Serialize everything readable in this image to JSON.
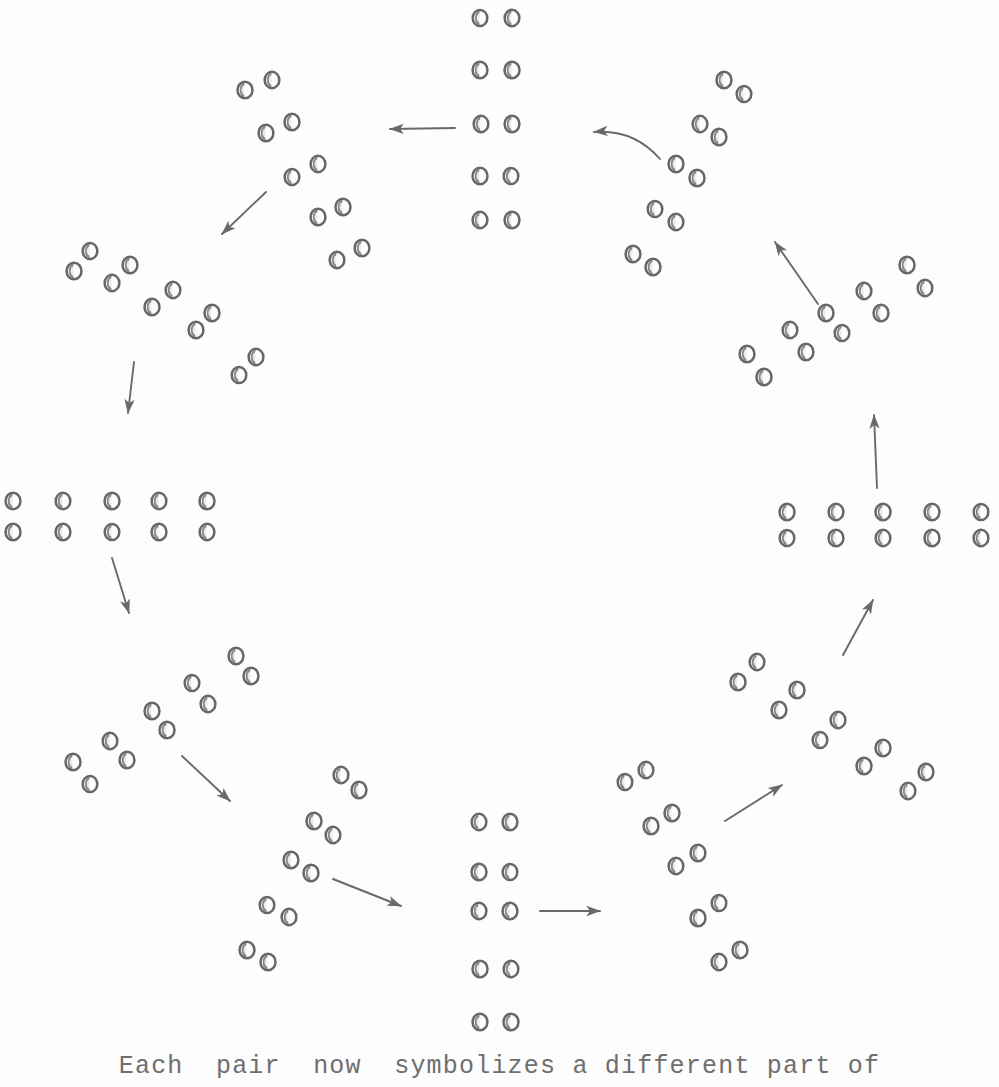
{
  "figure": {
    "type": "cycle-diagram",
    "background_color": "#fdfdfd",
    "ink_color": "#5a5a5a",
    "caption": "Each  pair  now  symbolizes a different part of",
    "pair_count_per_group": 5,
    "group_count": 12,
    "arrow_count": 12,
    "flow_direction": "counter-clockwise"
  },
  "chart_data": {
    "type": "scatter",
    "title": "",
    "xlabel": "",
    "ylabel": "",
    "groups": [
      {
        "id": "group-top",
        "name": "top-vertical-column",
        "orientation": "vertical",
        "angle_deg": 90,
        "pairs": [
          {
            "a": [
              480,
              18
            ],
            "b": [
              512,
              18
            ]
          },
          {
            "a": [
              480,
              70
            ],
            "b": [
              512,
              70
            ]
          },
          {
            "a": [
              481,
              124
            ],
            "b": [
              512,
              124
            ]
          },
          {
            "a": [
              480,
              176
            ],
            "b": [
              511,
              176
            ]
          },
          {
            "a": [
              480,
              220
            ],
            "b": [
              512,
              220
            ]
          }
        ]
      },
      {
        "id": "group-upper-left",
        "name": "upper-left-diagonal",
        "orientation": "diagonal-down-right",
        "angle_deg": 120,
        "pairs": [
          {
            "a": [
              245,
              90
            ],
            "b": [
              272,
              80
            ]
          },
          {
            "a": [
              266,
              133
            ],
            "b": [
              292,
              122
            ]
          },
          {
            "a": [
              292,
              177
            ],
            "b": [
              318,
              164
            ]
          },
          {
            "a": [
              318,
              217
            ],
            "b": [
              343,
              207
            ]
          },
          {
            "a": [
              337,
              260
            ],
            "b": [
              362,
              248
            ]
          }
        ]
      },
      {
        "id": "group-left-upper",
        "name": "left-upper-diagonal",
        "orientation": "diagonal-down-right",
        "angle_deg": 150,
        "pairs": [
          {
            "a": [
              74,
              271
            ],
            "b": [
              90,
              251
            ]
          },
          {
            "a": [
              112,
              283
            ],
            "b": [
              130,
              265
            ]
          },
          {
            "a": [
              152,
              307
            ],
            "b": [
              173,
              290
            ]
          },
          {
            "a": [
              196,
              330
            ],
            "b": [
              212,
              313
            ]
          },
          {
            "a": [
              239,
              375
            ],
            "b": [
              256,
              357
            ]
          }
        ]
      },
      {
        "id": "group-left",
        "name": "left-horizontal-row",
        "orientation": "horizontal",
        "angle_deg": 180,
        "pairs": [
          {
            "a": [
              13,
              501
            ],
            "b": [
              13,
              532
            ]
          },
          {
            "a": [
              63,
              501
            ],
            "b": [
              63,
              532
            ]
          },
          {
            "a": [
              112,
              501
            ],
            "b": [
              112,
              532
            ]
          },
          {
            "a": [
              159,
              501
            ],
            "b": [
              159,
              532
            ]
          },
          {
            "a": [
              207,
              501
            ],
            "b": [
              207,
              532
            ]
          }
        ]
      },
      {
        "id": "group-lower-left",
        "name": "lower-left-diagonal",
        "orientation": "diagonal-down-left",
        "angle_deg": 210,
        "pairs": [
          {
            "a": [
              236,
              656
            ],
            "b": [
              251,
              676
            ]
          },
          {
            "a": [
              192,
              683
            ],
            "b": [
              208,
              704
            ]
          },
          {
            "a": [
              152,
              711
            ],
            "b": [
              167,
              730
            ]
          },
          {
            "a": [
              110,
              741
            ],
            "b": [
              127,
              760
            ]
          },
          {
            "a": [
              73,
              762
            ],
            "b": [
              90,
              784
            ]
          }
        ]
      },
      {
        "id": "group-bottom-left",
        "name": "bottom-left-diagonal",
        "orientation": "diagonal-down-left",
        "angle_deg": 240,
        "pairs": [
          {
            "a": [
              341,
              775
            ],
            "b": [
              359,
              790
            ]
          },
          {
            "a": [
              314,
              821
            ],
            "b": [
              333,
              835
            ]
          },
          {
            "a": [
              291,
              860
            ],
            "b": [
              311,
              873
            ]
          },
          {
            "a": [
              267,
              905
            ],
            "b": [
              289,
              917
            ]
          },
          {
            "a": [
              247,
              950
            ],
            "b": [
              268,
              962
            ]
          }
        ]
      },
      {
        "id": "group-bottom",
        "name": "bottom-vertical-column",
        "orientation": "vertical",
        "angle_deg": 270,
        "pairs": [
          {
            "a": [
              479,
              822
            ],
            "b": [
              510,
              822
            ]
          },
          {
            "a": [
              479,
              872
            ],
            "b": [
              510,
              872
            ]
          },
          {
            "a": [
              479,
              911
            ],
            "b": [
              510,
              911
            ]
          },
          {
            "a": [
              480,
              969
            ],
            "b": [
              511,
              969
            ]
          },
          {
            "a": [
              480,
              1022
            ],
            "b": [
              511,
              1022
            ]
          }
        ]
      },
      {
        "id": "group-bottom-right",
        "name": "bottom-right-diagonal",
        "orientation": "diagonal-up-right",
        "angle_deg": 300,
        "pairs": [
          {
            "a": [
              625,
              782
            ],
            "b": [
              646,
              770
            ]
          },
          {
            "a": [
              651,
              826
            ],
            "b": [
              672,
              813
            ]
          },
          {
            "a": [
              676,
              866
            ],
            "b": [
              698,
              853
            ]
          },
          {
            "a": [
              698,
              918
            ],
            "b": [
              719,
              903
            ]
          },
          {
            "a": [
              719,
              962
            ],
            "b": [
              740,
              950
            ]
          }
        ]
      },
      {
        "id": "group-right-lower",
        "name": "right-lower-diagonal",
        "orientation": "diagonal-up-right",
        "angle_deg": 330,
        "pairs": [
          {
            "a": [
              738,
              682
            ],
            "b": [
              757,
              662
            ]
          },
          {
            "a": [
              779,
              710
            ],
            "b": [
              797,
              690
            ]
          },
          {
            "a": [
              820,
              740
            ],
            "b": [
              838,
              720
            ]
          },
          {
            "a": [
              864,
              766
            ],
            "b": [
              883,
              748
            ]
          },
          {
            "a": [
              908,
              791
            ],
            "b": [
              926,
              772
            ]
          }
        ]
      },
      {
        "id": "group-right",
        "name": "right-horizontal-row",
        "orientation": "horizontal",
        "angle_deg": 0,
        "pairs": [
          {
            "a": [
              787,
              512
            ],
            "b": [
              787,
              538
            ]
          },
          {
            "a": [
              836,
              512
            ],
            "b": [
              836,
              538
            ]
          },
          {
            "a": [
              883,
              512
            ],
            "b": [
              883,
              538
            ]
          },
          {
            "a": [
              932,
              512
            ],
            "b": [
              932,
              538
            ]
          },
          {
            "a": [
              981,
              512
            ],
            "b": [
              981,
              538
            ]
          }
        ]
      },
      {
        "id": "group-right-upper",
        "name": "right-upper-diagonal",
        "orientation": "diagonal-up-right",
        "angle_deg": 30,
        "pairs": [
          {
            "a": [
              747,
              354
            ],
            "b": [
              764,
              377
            ]
          },
          {
            "a": [
              790,
              330
            ],
            "b": [
              806,
              352
            ]
          },
          {
            "a": [
              826,
              313
            ],
            "b": [
              842,
              333
            ]
          },
          {
            "a": [
              864,
              291
            ],
            "b": [
              881,
              313
            ]
          },
          {
            "a": [
              907,
              265
            ],
            "b": [
              925,
              288
            ]
          }
        ]
      },
      {
        "id": "group-upper-right",
        "name": "upper-right-diagonal",
        "orientation": "diagonal-up-right",
        "angle_deg": 60,
        "pairs": [
          {
            "a": [
              633,
              254
            ],
            "b": [
              653,
              267
            ]
          },
          {
            "a": [
              655,
              209
            ],
            "b": [
              676,
              222
            ]
          },
          {
            "a": [
              676,
              164
            ],
            "b": [
              697,
              178
            ]
          },
          {
            "a": [
              700,
              124
            ],
            "b": [
              719,
              137
            ]
          },
          {
            "a": [
              724,
              80
            ],
            "b": [
              744,
              94
            ]
          }
        ]
      }
    ],
    "arrows": [
      {
        "id": "arrow-top-to-upper-left",
        "from": [
          455,
          128
        ],
        "to": [
          390,
          129
        ],
        "curve": 0
      },
      {
        "id": "arrow-upper-left-to-left-upper",
        "from": [
          266,
          192
        ],
        "to": [
          222,
          234
        ],
        "curve": 0
      },
      {
        "id": "arrow-left-upper-to-left",
        "from": [
          134,
          362
        ],
        "to": [
          128,
          413
        ],
        "curve": 0
      },
      {
        "id": "arrow-left-to-lower-left",
        "from": [
          112,
          558
        ],
        "to": [
          129,
          613
        ],
        "curve": 0
      },
      {
        "id": "arrow-lower-left-to-bottom-left",
        "from": [
          182,
          756
        ],
        "to": [
          230,
          801
        ],
        "curve": 0
      },
      {
        "id": "arrow-bottom-left-to-bottom",
        "from": [
          333,
          879
        ],
        "to": [
          401,
          906
        ],
        "curve": 0
      },
      {
        "id": "arrow-bottom-to-bottom-right",
        "from": [
          540,
          911
        ],
        "to": [
          600,
          911
        ],
        "curve": 0
      },
      {
        "id": "arrow-bottom-right-to-right-lower",
        "from": [
          725,
          821
        ],
        "to": [
          782,
          785
        ],
        "curve": 0
      },
      {
        "id": "arrow-right-lower-to-right",
        "from": [
          843,
          655
        ],
        "to": [
          873,
          600
        ],
        "curve": 0
      },
      {
        "id": "arrow-right-to-right-upper",
        "from": [
          877,
          488
        ],
        "to": [
          874,
          415
        ],
        "curve": 0
      },
      {
        "id": "arrow-right-upper-to-upper-right",
        "from": [
          818,
          304
        ],
        "to": [
          775,
          242
        ],
        "curve": 0
      },
      {
        "id": "arrow-upper-right-to-top",
        "from": [
          660,
          159
        ],
        "to": [
          594,
          132
        ],
        "curve": 18
      }
    ]
  }
}
